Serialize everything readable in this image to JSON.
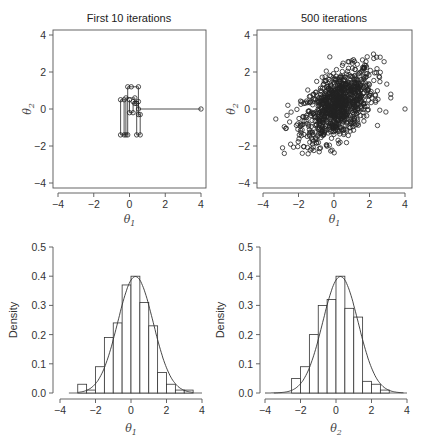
{
  "chart_data": [
    {
      "type": "line",
      "panel": "top-left",
      "title": "First 10 iterations",
      "xlabel": "θ1",
      "ylabel": "θ2",
      "xlim": [
        -4.3,
        4.3
      ],
      "ylim": [
        -4.3,
        4.3
      ],
      "xticks": [
        -4,
        -2,
        0,
        2,
        4
      ],
      "yticks": [
        -4,
        -2,
        0,
        2,
        4
      ],
      "grid": false,
      "trajectory": [
        [
          4.0,
          0.0
        ],
        [
          0.5,
          0.0
        ],
        [
          0.5,
          1.2
        ],
        [
          0.1,
          1.2
        ],
        [
          -0.1,
          1.2
        ],
        [
          -0.1,
          -1.4
        ],
        [
          -0.3,
          -1.4
        ],
        [
          -0.3,
          0.5
        ],
        [
          -0.5,
          0.5
        ],
        [
          -0.5,
          -1.4
        ],
        [
          -0.2,
          -1.4
        ],
        [
          -0.2,
          0.6
        ],
        [
          0.3,
          0.6
        ],
        [
          0.3,
          0.3
        ],
        [
          0.4,
          0.3
        ],
        [
          0.4,
          -1.4
        ],
        [
          0.6,
          -1.4
        ],
        [
          0.6,
          -0.3
        ],
        [
          0.5,
          -0.3
        ],
        [
          0.5,
          0.4
        ],
        [
          0.2,
          0.4
        ],
        [
          0.2,
          -0.2
        ],
        [
          0.0,
          -0.2
        ],
        [
          0.0,
          0.5
        ]
      ]
    },
    {
      "type": "scatter",
      "panel": "top-right",
      "title": "500 iterations",
      "xlabel": "θ1",
      "ylabel": "θ2",
      "xlim": [
        -4.3,
        4.3
      ],
      "ylim": [
        -4.3,
        4.3
      ],
      "xticks": [
        -4,
        -2,
        0,
        2,
        4
      ],
      "yticks": [
        -4,
        -2,
        0,
        2,
        4
      ],
      "grid": false,
      "n_points": 1000,
      "distribution": {
        "mean": [
          0.2,
          0.2
        ],
        "sd": [
          1.0,
          1.0
        ],
        "correlation": 0.5
      },
      "extra_points": [
        [
          4.0,
          0.0
        ],
        [
          -2.9,
          -2.1
        ],
        [
          -2.8,
          -2.4
        ],
        [
          2.4,
          2.8
        ],
        [
          2.6,
          2.8
        ],
        [
          3.2,
          0.8
        ],
        [
          3.2,
          0.6
        ],
        [
          -2.6,
          0.2
        ],
        [
          -2.5,
          -0.7
        ]
      ]
    },
    {
      "type": "bar",
      "panel": "bottom-left",
      "title": "",
      "xlabel": "θ1",
      "ylabel": "Density",
      "xlim": [
        -4,
        4
      ],
      "ylim": [
        0,
        0.5
      ],
      "xticks": [
        -4,
        -2,
        0,
        2,
        4
      ],
      "yticks": [
        0.0,
        0.1,
        0.2,
        0.3,
        0.4,
        0.5
      ],
      "ytick_labels": [
        "0.0",
        "0.1",
        "0.2",
        "0.3",
        "0.4",
        "0.5"
      ],
      "bin_width": 0.5,
      "bin_starts": [
        -3.0,
        -2.5,
        -2.0,
        -1.5,
        -1.0,
        -0.5,
        0.0,
        0.5,
        1.0,
        1.5,
        2.0,
        2.5,
        3.0
      ],
      "values": [
        0.03,
        0.01,
        0.09,
        0.19,
        0.24,
        0.37,
        0.4,
        0.31,
        0.23,
        0.07,
        0.03,
        0.01,
        0.01
      ],
      "density_curve": {
        "mean": 0.25,
        "sd": 1.0,
        "xrange": [
          -3.0,
          3.5
        ]
      }
    },
    {
      "type": "bar",
      "panel": "bottom-right",
      "title": "",
      "xlabel": "θ2",
      "ylabel": "Density",
      "xlim": [
        -4,
        4
      ],
      "ylim": [
        0,
        0.5
      ],
      "xticks": [
        -4,
        -2,
        0,
        2,
        4
      ],
      "yticks": [
        0.0,
        0.1,
        0.2,
        0.3,
        0.4,
        0.5
      ],
      "ytick_labels": [
        "0.0",
        "0.1",
        "0.2",
        "0.3",
        "0.4",
        "0.5"
      ],
      "bin_width": 0.5,
      "bin_starts": [
        -2.5,
        -2.0,
        -1.5,
        -1.0,
        -0.5,
        0.0,
        0.5,
        1.0,
        1.5,
        2.0,
        2.5
      ],
      "values": [
        0.05,
        0.09,
        0.2,
        0.3,
        0.32,
        0.4,
        0.29,
        0.26,
        0.04,
        0.03,
        0.01
      ],
      "density_curve": {
        "mean": 0.25,
        "sd": 1.0,
        "xrange": [
          -4.0,
          3.8
        ]
      }
    }
  ],
  "labels": {
    "title_tl": "First 10 iterations",
    "title_tr": "500 iterations",
    "theta": "θ",
    "sub1": "1",
    "sub2": "2",
    "density": "Density"
  }
}
